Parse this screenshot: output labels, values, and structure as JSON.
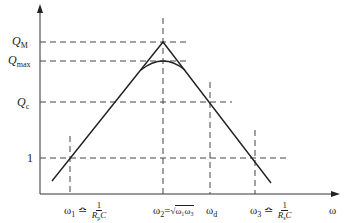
{
  "diagram": {
    "axes": {
      "x_label": "ω",
      "y_label": ""
    },
    "y_levels": [
      {
        "id": "QM",
        "label_main": "Q",
        "label_sub": "M"
      },
      {
        "id": "Qmax",
        "label_main": "Q",
        "label_sub": "max"
      },
      {
        "id": "Qc",
        "label_main": "Q",
        "label_sub": "c"
      },
      {
        "id": "one",
        "label_main": "1",
        "label_sub": ""
      }
    ],
    "x_marks": [
      {
        "id": "w1",
        "label_main": "ω",
        "label_sub": "1",
        "relation": "≏",
        "frac_num": "1",
        "frac_den": "R",
        "frac_den_sub": "p",
        "frac_den_tail": "C"
      },
      {
        "id": "w2",
        "label_main": "ω",
        "label_sub": "2",
        "relation": "=",
        "sqrt": "ω₁ω₃"
      },
      {
        "id": "wd",
        "label_main": "ω",
        "label_sub": "d"
      },
      {
        "id": "w3",
        "label_main": "ω",
        "label_sub": "3",
        "relation": "≏",
        "frac_num": "1",
        "frac_den": "R",
        "frac_den_sub": "s",
        "frac_den_tail": "C"
      }
    ],
    "colors": {
      "line": "#222222",
      "dash": "#444444",
      "background": "#ffffff"
    }
  }
}
